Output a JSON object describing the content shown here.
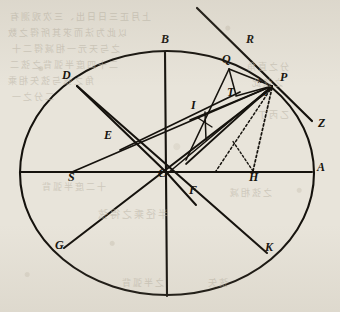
{
  "figure": {
    "ink_color": "#15120d",
    "paper_color": "#e8e4da",
    "bleed_color": "#b9b2a4",
    "circle": {
      "cx": 167,
      "cy": 173,
      "rx": 147,
      "ry": 122
    },
    "points": {
      "A": {
        "x": 312,
        "y": 172,
        "label_x": 317,
        "label_y": 172
      },
      "B": {
        "x": 165,
        "y": 52,
        "label_x": 161,
        "label_y": 44
      },
      "C": {
        "x": 167,
        "y": 173,
        "label_x": 158,
        "label_y": 178
      },
      "D": {
        "x": 77,
        "y": 86,
        "label_x": 62,
        "label_y": 80
      },
      "E": {
        "x": 113,
        "y": 140,
        "label_x": 104,
        "label_y": 140
      },
      "F": {
        "x": 186,
        "y": 191,
        "label_x": 189,
        "label_y": 195
      },
      "G": {
        "x": 64,
        "y": 248,
        "label_x": 55,
        "label_y": 250
      },
      "H": {
        "x": 253,
        "y": 172,
        "label_x": 249,
        "label_y": 182
      },
      "I": {
        "x": 197,
        "y": 113,
        "label_x": 191,
        "label_y": 110
      },
      "K": {
        "x": 265,
        "y": 252,
        "label_x": 265,
        "label_y": 252
      },
      "P": {
        "x": 272,
        "y": 86,
        "label_x": 280,
        "label_y": 82
      },
      "Q": {
        "x": 229,
        "y": 68,
        "label_x": 222,
        "label_y": 64
      },
      "R": {
        "x": 240,
        "y": 48,
        "label_x": 246,
        "label_y": 44
      },
      "S": {
        "x": 72,
        "y": 172,
        "label_x": 68,
        "label_y": 182
      },
      "T": {
        "x": 234,
        "y": 97,
        "label_x": 227,
        "label_y": 97
      },
      "Z": {
        "x": 312,
        "y": 120,
        "label_x": 318,
        "label_y": 128
      },
      "x": {
        "label_x": 258,
        "label_y": 85
      },
      "e": {
        "label_x": 264,
        "label_y": 98
      }
    },
    "point_labels": [
      "A",
      "B",
      "C",
      "D",
      "E",
      "F",
      "G",
      "H",
      "I",
      "K",
      "P",
      "Q",
      "R",
      "S",
      "T",
      "Z"
    ],
    "small_labels": [
      "x",
      "e"
    ],
    "bleed_text": [
      {
        "text": "上月正三日日出、三次观测有",
        "x": 8,
        "y": 10,
        "size": 9
      },
      {
        "text": "以此为法而求其所得之数",
        "x": 6,
        "y": 26,
        "size": 9
      },
      {
        "text": "之与天元一相减得二十",
        "x": 10,
        "y": 42,
        "size": 9
      },
      {
        "text": "二十四度半弧背之弦二",
        "x": 8,
        "y": 58,
        "size": 9
      },
      {
        "text": "角之弦与弦矢相乘",
        "x": 6,
        "y": 74,
        "size": 9
      },
      {
        "text": "二分之一",
        "x": 10,
        "y": 90,
        "size": 9
      },
      {
        "text": "分之直角",
        "x": 245,
        "y": 60,
        "size": 9
      },
      {
        "text": "之弦此",
        "x": 250,
        "y": 76,
        "size": 9
      },
      {
        "text": "乙丙丁",
        "x": 256,
        "y": 108,
        "size": 9
      },
      {
        "text": "十二度半弧背",
        "x": 40,
        "y": 180,
        "size": 9
      },
      {
        "text": "之弦相减",
        "x": 228,
        "y": 186,
        "size": 9
      },
      {
        "text": "半径乘之得弦",
        "x": 96,
        "y": 206,
        "size": 10
      },
      {
        "text": "之半弧背",
        "x": 120,
        "y": 276,
        "size": 9
      },
      {
        "text": "弦矢",
        "x": 206,
        "y": 276,
        "size": 9
      }
    ]
  }
}
